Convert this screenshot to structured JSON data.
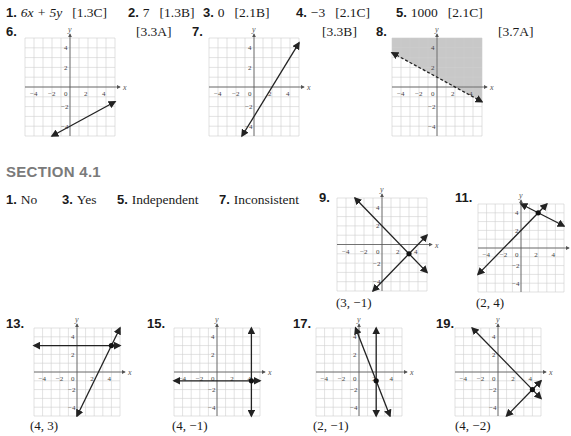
{
  "review": {
    "items": [
      {
        "num": "1.",
        "answer": "6x + 5y",
        "ref": "[1.3C]"
      },
      {
        "num": "2.",
        "answer": "7",
        "ref": "[1.3B]"
      },
      {
        "num": "3.",
        "answer": "0",
        "ref": "[2.1B]"
      },
      {
        "num": "4.",
        "answer": "−3",
        "ref": "[2.1C]"
      },
      {
        "num": "5.",
        "answer": "1000",
        "ref": "[2.1C]"
      }
    ],
    "graph_items": [
      {
        "num": "6.",
        "ref": "[3.3A]"
      },
      {
        "num": "7.",
        "ref": "[3.3B]"
      },
      {
        "num": "8.",
        "ref": "[3.7A]"
      }
    ]
  },
  "section": {
    "title": "SECTION 4.1",
    "text_answers": [
      {
        "num": "1.",
        "answer": "No"
      },
      {
        "num": "3.",
        "answer": "Yes"
      },
      {
        "num": "5.",
        "answer": "Independent"
      },
      {
        "num": "7.",
        "answer": "Inconsistent"
      }
    ],
    "graph_answers": [
      {
        "num": "9.",
        "solution": "(3, −1)"
      },
      {
        "num": "11.",
        "solution": "(2, 4)"
      },
      {
        "num": "13.",
        "solution": "(4, 3)"
      },
      {
        "num": "15.",
        "solution": "(4, −1)"
      },
      {
        "num": "17.",
        "solution": "(2, −1)"
      },
      {
        "num": "19.",
        "solution": "(4, −2)"
      }
    ]
  },
  "axis": {
    "x_label": "x",
    "y_label": "y",
    "x_ticks": [
      "−4",
      "−2",
      "0",
      "2",
      "4"
    ],
    "y_ticks": [
      "4",
      "2",
      "−2",
      "−4"
    ]
  },
  "chart_data": [
    {
      "id": "g6",
      "type": "line",
      "range": [
        -5,
        5
      ],
      "lines": [
        {
          "kind": "slope",
          "m": 0.5,
          "b": -4
        }
      ],
      "points": []
    },
    {
      "id": "g7",
      "type": "line",
      "range": [
        -5,
        5
      ],
      "lines": [
        {
          "kind": "slope",
          "m": 1.5,
          "b": -3
        }
      ],
      "points": []
    },
    {
      "id": "g8",
      "type": "area",
      "range": [
        -5,
        5
      ],
      "lines": [
        {
          "kind": "slope",
          "m": -0.5,
          "b": 1,
          "dashed": true
        }
      ],
      "shade": "above",
      "shade_color": "#c8c8c8",
      "points": []
    },
    {
      "id": "g9",
      "type": "line",
      "range": [
        -5,
        5
      ],
      "lines": [
        {
          "kind": "slope",
          "m": -1,
          "b": 2
        },
        {
          "kind": "slope",
          "m": 1,
          "b": -4
        }
      ],
      "points": [
        [
          3,
          -1
        ]
      ]
    },
    {
      "id": "g11",
      "type": "line",
      "range": [
        -5,
        5
      ],
      "lines": [
        {
          "kind": "slope",
          "m": 1,
          "b": 2
        },
        {
          "kind": "slope",
          "m": -0.5,
          "b": 5
        }
      ],
      "points": [
        [
          2,
          4
        ]
      ]
    },
    {
      "id": "g13",
      "type": "line",
      "range": [
        -5,
        5
      ],
      "lines": [
        {
          "kind": "horizontal",
          "y": 3
        },
        {
          "kind": "slope",
          "m": 2,
          "b": -5
        }
      ],
      "points": [
        [
          4,
          3
        ]
      ]
    },
    {
      "id": "g15",
      "type": "line",
      "range": [
        -5,
        5
      ],
      "lines": [
        {
          "kind": "vertical",
          "x": 4
        },
        {
          "kind": "horizontal",
          "y": -1
        }
      ],
      "points": [
        [
          4,
          -1
        ]
      ]
    },
    {
      "id": "g17",
      "type": "line",
      "range": [
        -5,
        5
      ],
      "lines": [
        {
          "kind": "vertical",
          "x": 2
        },
        {
          "kind": "slope",
          "m": -2.5,
          "b": 4
        }
      ],
      "points": [
        [
          2,
          -1
        ]
      ]
    },
    {
      "id": "g19",
      "type": "line",
      "range": [
        -5,
        5
      ],
      "lines": [
        {
          "kind": "slope",
          "m": -1,
          "b": 2
        },
        {
          "kind": "slope",
          "m": 1,
          "b": -6
        }
      ],
      "points": [
        [
          4,
          -2
        ]
      ]
    }
  ]
}
